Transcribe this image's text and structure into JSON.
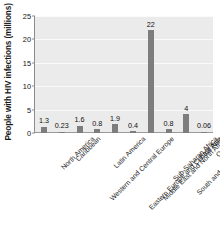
{
  "chart_data": {
    "type": "bar",
    "title": "",
    "xlabel": "",
    "ylabel": "People with HIV infections (millions)",
    "ylim": [
      0,
      25
    ],
    "yticks": [
      0,
      5,
      10,
      15,
      20,
      25
    ],
    "grid": true,
    "legend": "none",
    "categories": [
      "North America",
      "Caribbean",
      "Western and Central Europe",
      "Latin America",
      "Eastern Europe and Central Asia",
      "Middle East and North Africa",
      "Sub-Saharan Africa",
      "South and Southeast Asia",
      "East Asia",
      "Oceania"
    ],
    "values": [
      1.3,
      0.23,
      1.6,
      0.8,
      1.9,
      0.4,
      22,
      0.8,
      4,
      0.06
    ],
    "value_labels": [
      "1.3",
      "0.23",
      "1.6",
      "0.8",
      "1.9",
      "0.4",
      "22",
      "0.8",
      "4",
      "0.06"
    ],
    "bar_color": "#7d7d7d",
    "plot_background": "#ebebeb",
    "gridline_color": "#fafafa",
    "axis_color": "#8c8c8c"
  }
}
